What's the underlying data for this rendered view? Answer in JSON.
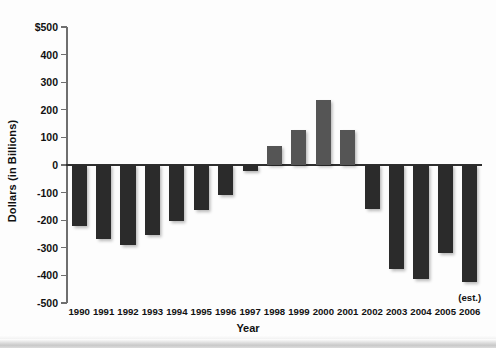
{
  "chart_data": {
    "type": "bar",
    "title": "",
    "xlabel": "Year",
    "ylabel": "Dollars (in Billions)",
    "categories": [
      "1990",
      "1991",
      "1992",
      "1993",
      "1994",
      "1995",
      "1996",
      "1997",
      "1998",
      "1999",
      "2000",
      "2001",
      "2002",
      "2003",
      "2004",
      "2005",
      "2006"
    ],
    "values": [
      -221,
      -269,
      -290,
      -255,
      -203,
      -164,
      -107,
      -22,
      69,
      126,
      236,
      128,
      -158,
      -378,
      -413,
      -318,
      -423
    ],
    "ylim": [
      -500,
      500
    ],
    "ytick_labels": [
      "$500",
      "400",
      "300",
      "200",
      "100",
      "0",
      "-100",
      "-200",
      "-300",
      "-400",
      "-500"
    ],
    "ytick_values": [
      500,
      400,
      300,
      200,
      100,
      0,
      -100,
      -200,
      -300,
      -400,
      -500
    ],
    "grid": false,
    "legend": null,
    "annotations": [
      {
        "text": "(est.)",
        "category": "2006"
      }
    ],
    "colors": {
      "negative_bar": "#2b2b2b",
      "positive_bar": "#555555",
      "axis": "#6f6f6f",
      "zero_line": "#2f2f2f",
      "background": "#fdfdfd",
      "text": "#111111"
    }
  }
}
